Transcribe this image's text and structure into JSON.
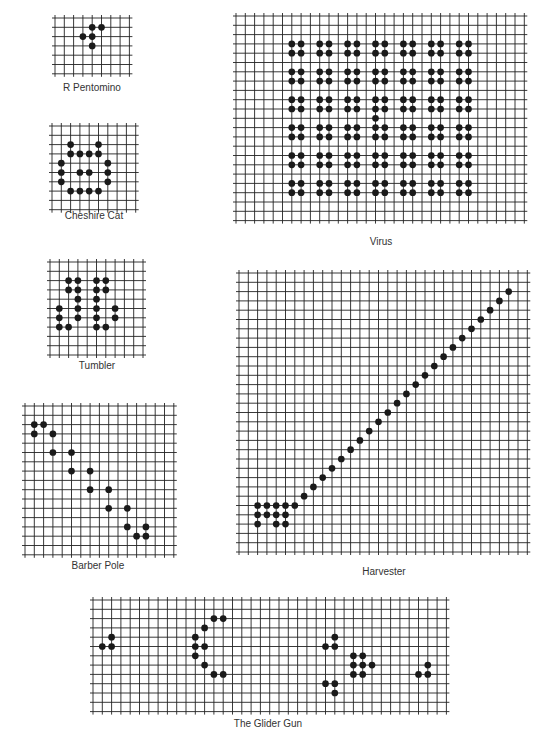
{
  "style": {
    "line_color": "#222222",
    "cell_color": "#1a1a1a",
    "cell_size": 9.3
  },
  "patterns": [
    {
      "id": "r-pentomino",
      "label": "R Pentomino",
      "x": 55,
      "y": 18,
      "cols": 8,
      "rows": 6,
      "label_x": 92,
      "label_y": 82,
      "cells": [
        [
          4,
          1
        ],
        [
          5,
          1
        ],
        [
          3,
          2
        ],
        [
          4,
          2
        ],
        [
          4,
          3
        ]
      ]
    },
    {
      "id": "cheshire-cat",
      "label": "Cheshire Cat",
      "x": 52,
      "y": 126,
      "cols": 9,
      "rows": 9,
      "label_x": 94,
      "label_y": 210,
      "cells": [
        [
          2,
          2
        ],
        [
          5,
          2
        ],
        [
          2,
          3
        ],
        [
          3,
          3
        ],
        [
          4,
          3
        ],
        [
          5,
          3
        ],
        [
          1,
          4
        ],
        [
          6,
          4
        ],
        [
          1,
          5
        ],
        [
          3,
          5
        ],
        [
          4,
          5
        ],
        [
          6,
          5
        ],
        [
          1,
          6
        ],
        [
          6,
          6
        ],
        [
          2,
          7
        ],
        [
          3,
          7
        ],
        [
          4,
          7
        ],
        [
          5,
          7
        ]
      ]
    },
    {
      "id": "tumbler",
      "label": "Tumbler",
      "x": 50,
      "y": 262,
      "cols": 10,
      "rows": 10,
      "label_x": 97,
      "label_y": 360,
      "cells": [
        [
          2,
          2
        ],
        [
          3,
          2
        ],
        [
          5,
          2
        ],
        [
          6,
          2
        ],
        [
          2,
          3
        ],
        [
          3,
          3
        ],
        [
          5,
          3
        ],
        [
          6,
          3
        ],
        [
          3,
          4
        ],
        [
          5,
          4
        ],
        [
          1,
          5
        ],
        [
          3,
          5
        ],
        [
          5,
          5
        ],
        [
          7,
          5
        ],
        [
          1,
          6
        ],
        [
          3,
          6
        ],
        [
          5,
          6
        ],
        [
          7,
          6
        ],
        [
          1,
          7
        ],
        [
          2,
          7
        ],
        [
          5,
          7
        ],
        [
          6,
          7
        ]
      ]
    },
    {
      "id": "barber-pole",
      "label": "Barber Pole",
      "x": 25,
      "y": 406,
      "cols": 16,
      "rows": 16,
      "label_x": 98,
      "label_y": 560,
      "cells": [
        [
          1,
          2
        ],
        [
          2,
          2
        ],
        [
          1,
          3
        ],
        [
          3,
          3
        ],
        [
          3,
          5
        ],
        [
          5,
          5
        ],
        [
          5,
          7
        ],
        [
          7,
          7
        ],
        [
          7,
          9
        ],
        [
          9,
          9
        ],
        [
          9,
          11
        ],
        [
          11,
          11
        ],
        [
          11,
          13
        ],
        [
          13,
          13
        ],
        [
          12,
          14
        ],
        [
          13,
          14
        ]
      ]
    },
    {
      "id": "virus",
      "label": "Virus",
      "x": 236,
      "y": 16,
      "cols": 31,
      "rows": 22,
      "label_x": 381,
      "label_y": 236,
      "cells": [
        [
          6,
          3
        ],
        [
          7,
          3
        ],
        [
          6,
          4
        ],
        [
          7,
          4
        ],
        [
          9,
          3
        ],
        [
          10,
          3
        ],
        [
          9,
          4
        ],
        [
          10,
          4
        ],
        [
          12,
          3
        ],
        [
          13,
          3
        ],
        [
          12,
          4
        ],
        [
          13,
          4
        ],
        [
          15,
          3
        ],
        [
          16,
          3
        ],
        [
          15,
          4
        ],
        [
          16,
          4
        ],
        [
          18,
          3
        ],
        [
          19,
          3
        ],
        [
          18,
          4
        ],
        [
          19,
          4
        ],
        [
          21,
          3
        ],
        [
          22,
          3
        ],
        [
          21,
          4
        ],
        [
          22,
          4
        ],
        [
          24,
          3
        ],
        [
          25,
          3
        ],
        [
          24,
          4
        ],
        [
          25,
          4
        ],
        [
          6,
          6
        ],
        [
          7,
          6
        ],
        [
          6,
          7
        ],
        [
          7,
          7
        ],
        [
          9,
          6
        ],
        [
          10,
          6
        ],
        [
          9,
          7
        ],
        [
          10,
          7
        ],
        [
          12,
          6
        ],
        [
          13,
          6
        ],
        [
          12,
          7
        ],
        [
          13,
          7
        ],
        [
          15,
          6
        ],
        [
          16,
          6
        ],
        [
          15,
          7
        ],
        [
          16,
          7
        ],
        [
          18,
          6
        ],
        [
          19,
          6
        ],
        [
          18,
          7
        ],
        [
          19,
          7
        ],
        [
          21,
          6
        ],
        [
          22,
          6
        ],
        [
          21,
          7
        ],
        [
          22,
          7
        ],
        [
          24,
          6
        ],
        [
          25,
          6
        ],
        [
          24,
          7
        ],
        [
          25,
          7
        ],
        [
          6,
          9
        ],
        [
          7,
          9
        ],
        [
          6,
          10
        ],
        [
          7,
          10
        ],
        [
          9,
          9
        ],
        [
          10,
          9
        ],
        [
          9,
          10
        ],
        [
          10,
          10
        ],
        [
          12,
          9
        ],
        [
          13,
          9
        ],
        [
          12,
          10
        ],
        [
          13,
          10
        ],
        [
          15,
          9
        ],
        [
          16,
          9
        ],
        [
          15,
          10
        ],
        [
          16,
          10
        ],
        [
          18,
          9
        ],
        [
          19,
          9
        ],
        [
          18,
          10
        ],
        [
          19,
          10
        ],
        [
          21,
          9
        ],
        [
          22,
          9
        ],
        [
          21,
          10
        ],
        [
          22,
          10
        ],
        [
          24,
          9
        ],
        [
          25,
          9
        ],
        [
          24,
          10
        ],
        [
          25,
          10
        ],
        [
          15,
          11
        ],
        [
          6,
          12
        ],
        [
          7,
          12
        ],
        [
          6,
          13
        ],
        [
          7,
          13
        ],
        [
          9,
          12
        ],
        [
          10,
          12
        ],
        [
          9,
          13
        ],
        [
          10,
          13
        ],
        [
          12,
          12
        ],
        [
          13,
          12
        ],
        [
          12,
          13
        ],
        [
          13,
          13
        ],
        [
          15,
          12
        ],
        [
          16,
          12
        ],
        [
          15,
          13
        ],
        [
          16,
          13
        ],
        [
          18,
          12
        ],
        [
          19,
          12
        ],
        [
          18,
          13
        ],
        [
          19,
          13
        ],
        [
          21,
          12
        ],
        [
          22,
          12
        ],
        [
          21,
          13
        ],
        [
          22,
          13
        ],
        [
          24,
          12
        ],
        [
          25,
          12
        ],
        [
          24,
          13
        ],
        [
          25,
          13
        ],
        [
          6,
          15
        ],
        [
          7,
          15
        ],
        [
          6,
          16
        ],
        [
          7,
          16
        ],
        [
          9,
          15
        ],
        [
          10,
          15
        ],
        [
          9,
          16
        ],
        [
          10,
          16
        ],
        [
          12,
          15
        ],
        [
          13,
          15
        ],
        [
          12,
          16
        ],
        [
          13,
          16
        ],
        [
          15,
          15
        ],
        [
          16,
          15
        ],
        [
          15,
          16
        ],
        [
          16,
          16
        ],
        [
          18,
          15
        ],
        [
          19,
          15
        ],
        [
          18,
          16
        ],
        [
          19,
          16
        ],
        [
          21,
          15
        ],
        [
          22,
          15
        ],
        [
          21,
          16
        ],
        [
          22,
          16
        ],
        [
          24,
          15
        ],
        [
          25,
          15
        ],
        [
          24,
          16
        ],
        [
          25,
          16
        ],
        [
          6,
          18
        ],
        [
          7,
          18
        ],
        [
          6,
          19
        ],
        [
          7,
          19
        ],
        [
          9,
          18
        ],
        [
          10,
          18
        ],
        [
          9,
          19
        ],
        [
          10,
          19
        ],
        [
          12,
          18
        ],
        [
          13,
          18
        ],
        [
          12,
          19
        ],
        [
          13,
          19
        ],
        [
          15,
          18
        ],
        [
          16,
          18
        ],
        [
          15,
          19
        ],
        [
          16,
          19
        ],
        [
          18,
          18
        ],
        [
          19,
          18
        ],
        [
          18,
          19
        ],
        [
          19,
          19
        ],
        [
          21,
          18
        ],
        [
          22,
          18
        ],
        [
          21,
          19
        ],
        [
          22,
          19
        ],
        [
          24,
          18
        ],
        [
          25,
          18
        ],
        [
          24,
          19
        ],
        [
          25,
          19
        ]
      ]
    },
    {
      "id": "harvester",
      "label": "Harvester",
      "x": 239,
      "y": 273,
      "cols": 31,
      "rows": 30,
      "label_x": 384,
      "label_y": 566,
      "cells": [
        [
          2,
          25
        ],
        [
          3,
          25
        ],
        [
          4,
          25
        ],
        [
          5,
          25
        ],
        [
          6,
          25
        ],
        [
          2,
          26
        ],
        [
          3,
          26
        ],
        [
          4,
          26
        ],
        [
          5,
          26
        ],
        [
          2,
          27
        ],
        [
          4,
          27
        ],
        [
          5,
          27
        ],
        [
          7,
          24
        ],
        [
          8,
          23
        ],
        [
          9,
          22
        ],
        [
          10,
          21
        ],
        [
          11,
          20
        ],
        [
          12,
          19
        ],
        [
          13,
          18
        ],
        [
          14,
          17
        ],
        [
          15,
          16
        ],
        [
          16,
          15
        ],
        [
          17,
          14
        ],
        [
          18,
          13
        ],
        [
          19,
          12
        ],
        [
          20,
          11
        ],
        [
          21,
          10
        ],
        [
          22,
          9
        ],
        [
          23,
          8
        ],
        [
          24,
          7
        ],
        [
          25,
          6
        ],
        [
          26,
          5
        ],
        [
          27,
          4
        ],
        [
          28,
          3
        ],
        [
          29,
          2
        ]
      ]
    },
    {
      "id": "glider-gun",
      "label": "The Glider Gun",
      "x": 93,
      "y": 600,
      "cols": 38,
      "rows": 12,
      "label_x": 268,
      "label_y": 718,
      "cells": [
        [
          1,
          5
        ],
        [
          2,
          5
        ],
        [
          2,
          4
        ],
        [
          12,
          5
        ],
        [
          11,
          4
        ],
        [
          11,
          5
        ],
        [
          11,
          6
        ],
        [
          12,
          3
        ],
        [
          13,
          2
        ],
        [
          14,
          2
        ],
        [
          12,
          7
        ],
        [
          13,
          8
        ],
        [
          14,
          8
        ],
        [
          26,
          4
        ],
        [
          25,
          5
        ],
        [
          26,
          5
        ],
        [
          28,
          6
        ],
        [
          29,
          6
        ],
        [
          28,
          7
        ],
        [
          29,
          7
        ],
        [
          30,
          7
        ],
        [
          28,
          8
        ],
        [
          29,
          8
        ],
        [
          25,
          9
        ],
        [
          26,
          9
        ],
        [
          26,
          10
        ],
        [
          36,
          7
        ],
        [
          35,
          8
        ],
        [
          36,
          8
        ]
      ]
    }
  ]
}
